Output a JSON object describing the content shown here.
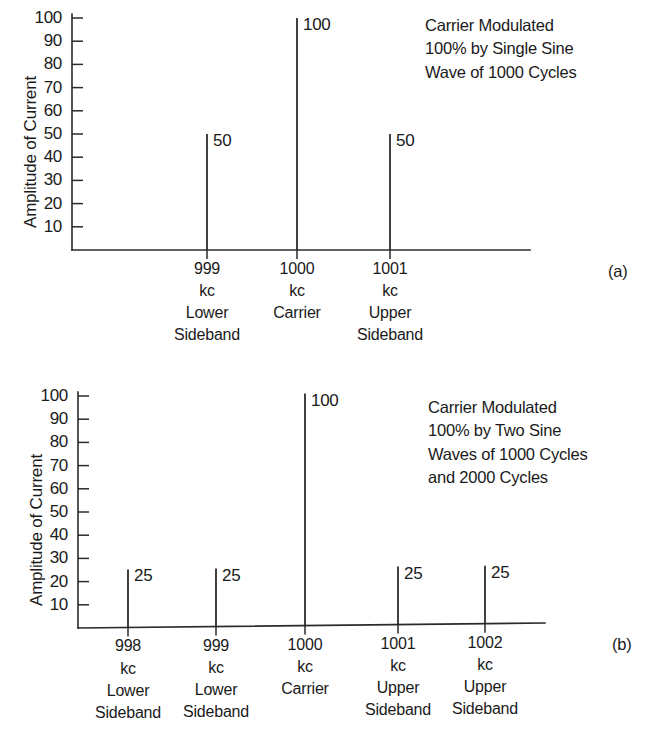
{
  "document": {
    "title": "Amplitude Spectra of Amplitude-Modulated Carrier"
  },
  "chart_data": [
    {
      "id": "figure-a",
      "type": "bar",
      "title": "",
      "panel_tag": "(a)",
      "xlabel": "",
      "ylabel": "Amplitude of Current",
      "ylim": [
        0,
        100
      ],
      "yticks": [
        10,
        20,
        30,
        40,
        50,
        60,
        70,
        80,
        90,
        100
      ],
      "ytick_labels": [
        "10",
        "20",
        "30",
        "40",
        "50",
        "60",
        "70",
        "80",
        "90",
        "100"
      ],
      "grid": false,
      "legend": false,
      "categories": [
        "999 kc",
        "1000 kc",
        "1001 kc"
      ],
      "values": [
        50,
        100,
        50
      ],
      "data_labels": [
        "50",
        "100",
        "50"
      ],
      "annotation": "Carrier Modulated\n100% by Single Sine\nWave of 1000 Cycles",
      "annotation_lines": [
        "Carrier Modulated",
        "100% by Single Sine",
        "Wave of 1000 Cycles"
      ],
      "xtick_groups": [
        {
          "frequency": "999",
          "unit": "kc",
          "role_line1": "Lower",
          "role_line2": "Sideband"
        },
        {
          "frequency": "1000",
          "unit": "kc",
          "role_line1": "Carrier",
          "role_line2": ""
        },
        {
          "frequency": "1001",
          "unit": "kc",
          "role_line1": "Upper",
          "role_line2": "Sideband"
        }
      ]
    },
    {
      "id": "figure-b",
      "type": "bar",
      "title": "",
      "panel_tag": "(b)",
      "xlabel": "",
      "ylabel": "Amplitude of Current",
      "ylim": [
        0,
        100
      ],
      "yticks": [
        10,
        20,
        30,
        40,
        50,
        60,
        70,
        80,
        90,
        100
      ],
      "ytick_labels": [
        "10",
        "20",
        "30",
        "40",
        "50",
        "60",
        "70",
        "80",
        "90",
        "100"
      ],
      "grid": false,
      "legend": false,
      "categories": [
        "998 kc",
        "999 kc",
        "1000 kc",
        "1001 kc",
        "1002 kc"
      ],
      "values": [
        25,
        25,
        100,
        25,
        25
      ],
      "data_labels": [
        "25",
        "25",
        "100",
        "25",
        "25"
      ],
      "annotation": "Carrier Modulated\n100% by Two Sine\nWaves of 1000 Cycles\nand 2000 Cycles",
      "annotation_lines": [
        "Carrier Modulated",
        "100% by Two Sine",
        "Waves of 1000 Cycles",
        "and 2000 Cycles"
      ],
      "xtick_groups": [
        {
          "frequency": "998",
          "unit": "kc",
          "role_line1": "Lower",
          "role_line2": "Sideband"
        },
        {
          "frequency": "999",
          "unit": "kc",
          "role_line1": "Lower",
          "role_line2": "Sideband"
        },
        {
          "frequency": "1000",
          "unit": "kc",
          "role_line1": "Carrier",
          "role_line2": ""
        },
        {
          "frequency": "1001",
          "unit": "kc",
          "role_line1": "Upper",
          "role_line2": "Sideband"
        },
        {
          "frequency": "1002",
          "unit": "kc",
          "role_line1": "Upper",
          "role_line2": "Sideband"
        }
      ]
    }
  ],
  "colors": {
    "ink": "#1a1a1a",
    "axis": "#2b2b2b",
    "background": "#ffffff"
  }
}
